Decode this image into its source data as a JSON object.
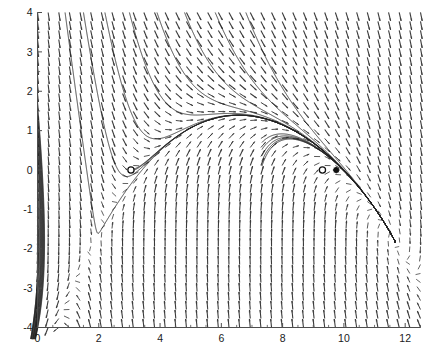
{
  "figure": {
    "kind": "phase-portrait",
    "background_color": "#ffffff",
    "axis_color": "#4d4d4d",
    "field_color": "#3a3a3a",
    "trajectory_color": "#222222"
  },
  "chart_data": {
    "type": "scatter",
    "title": "",
    "subtitle": "",
    "xlabel": "",
    "ylabel": "",
    "xlim": [
      0,
      12.5
    ],
    "ylim": [
      -4,
      4
    ],
    "grid": false,
    "legend": false,
    "legend_position": "none",
    "xticks": [
      0,
      2,
      4,
      6,
      8,
      10,
      12
    ],
    "xtick_labels": [
      "0",
      "2",
      "4",
      "6",
      "8",
      "10",
      "12"
    ],
    "yticks": [
      -4,
      -3,
      -2,
      -1,
      0,
      1,
      2,
      3,
      4
    ],
    "ytick_labels": [
      "-4",
      "-3",
      "-2",
      "-1",
      "0",
      "1",
      "2",
      "3",
      "4"
    ],
    "minor_xticks": [
      0.5,
      1,
      1.5,
      2.5,
      3,
      3.5,
      4.5,
      5,
      5.5,
      6.5,
      7,
      7.5,
      8.5,
      9,
      9.5,
      10.5,
      11,
      11.5,
      12.5
    ],
    "series": [
      {
        "name": "vector-field",
        "type": "quiver",
        "x_start": 0.0,
        "x_step": 0.3472,
        "x_count": 37,
        "y_start": -4.0,
        "y_step": 0.2286,
        "y_count": 36,
        "arrow_scale": 0.26,
        "note": "direction field of planar autonomous ODE"
      },
      {
        "name": "critical-points",
        "type": "markers",
        "points": [
          {
            "x": 3.05,
            "y": 0.0,
            "marker": "open-circle",
            "label": ""
          },
          {
            "x": 9.3,
            "y": 0.0,
            "marker": "open-circle",
            "label": ""
          },
          {
            "x": 9.75,
            "y": 0.0,
            "marker": "filled-dot",
            "label": ""
          }
        ]
      },
      {
        "name": "trajectories",
        "type": "streamlines",
        "count": 26
      }
    ]
  }
}
